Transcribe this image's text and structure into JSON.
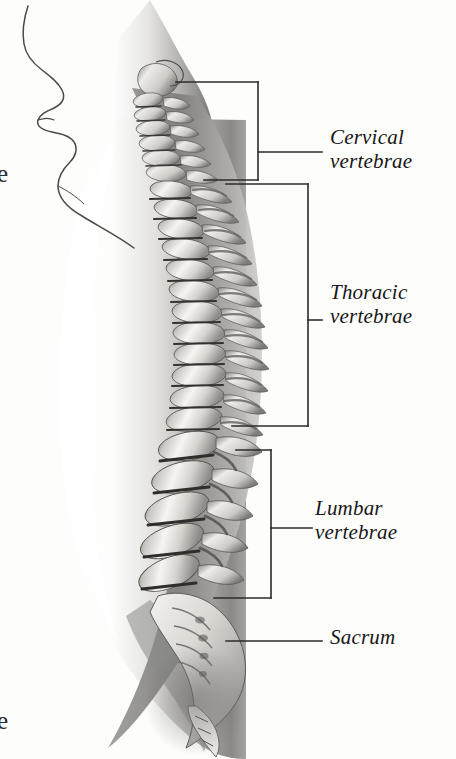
{
  "figure": {
    "view": "lateral-left",
    "style": "grayscale-airbrush-medical-illustration",
    "background_color": "#fdfdfc",
    "ink_color": "#171717",
    "body_shade_color": "#8d8d8d",
    "bone_highlight_color": "#f2f0ec",
    "disc_shadow_color": "#3a3a3a"
  },
  "labels": [
    {
      "id": "cervical",
      "text": "Cervical\nvertebrae",
      "bracket": "square",
      "region_top": 82,
      "region_bottom": 180,
      "leader_y": 152
    },
    {
      "id": "thoracic",
      "text": "Thoracic\nvertebrae",
      "bracket": "square",
      "region_top": 184,
      "region_bottom": 426,
      "leader_y": 320
    },
    {
      "id": "lumbar",
      "text": "Lumbar\nvertebrae",
      "bracket": "square",
      "region_top": 450,
      "region_bottom": 598,
      "leader_y": 528
    },
    {
      "id": "sacrum",
      "text": "Sacrum",
      "bracket": "line",
      "leader_y": 641
    }
  ],
  "edge_fragments": [
    {
      "id": "top",
      "text": "e"
    },
    {
      "id": "bottom",
      "text": "e"
    }
  ]
}
